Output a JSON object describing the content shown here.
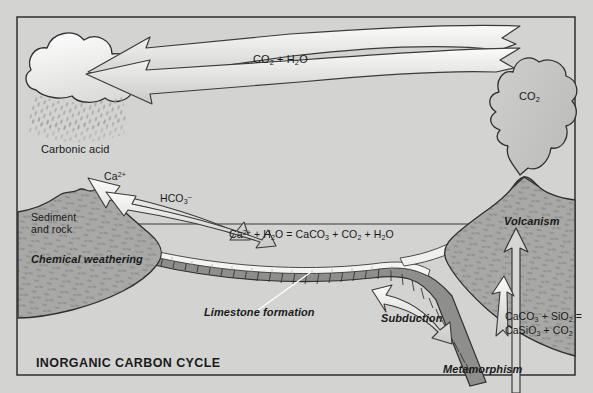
{
  "figure": {
    "title": "INORGANIC CARBON CYCLE",
    "background_color": "#d3d3d2",
    "border_color": "#3a3a3a",
    "land_color": "#a8a8a6",
    "crust_color": "#8e8e8c",
    "cloud_color": "#f2f2f0",
    "limestone_color": "#f4f4f2"
  },
  "labels": {
    "atmosphere_reaction": "CO2 + H2O",
    "volcanic_gas": "CO2",
    "carbonic_acid": "Carbonic acid",
    "calcium_ion": "Ca2+",
    "bicarbonate_ion": "HCO3-",
    "sediment_and_rock": "Sediment and rock",
    "chemical_weathering": "Chemical weathering",
    "ocean_reaction": "Ca2+ + H2O = CaCO3 + CO2 + H2O",
    "limestone_formation": "Limestone formation",
    "subduction": "Subduction",
    "metamorphism": "Metamorphism",
    "volcanism": "Volcanism",
    "metamorphism_reaction_line1": "CaCO3 + SiO2 =",
    "metamorphism_reaction_line2": "CaSiO3 + CO2"
  },
  "processes": [
    {
      "name": "chemical-weathering",
      "label": "Chemical weathering"
    },
    {
      "name": "limestone-formation",
      "label": "Limestone formation"
    },
    {
      "name": "subduction",
      "label": "Subduction"
    },
    {
      "name": "metamorphism",
      "label": "Metamorphism"
    },
    {
      "name": "volcanism",
      "label": "Volcanism"
    }
  ],
  "reactions": [
    {
      "name": "ocean-carbonate",
      "equation": "Ca2+ + H2O = CaCO3 + CO2 + H2O"
    },
    {
      "name": "metamorphic-decarbonation",
      "equation": "CaCO3 + SiO2 = CaSiO3 + CO2"
    }
  ]
}
